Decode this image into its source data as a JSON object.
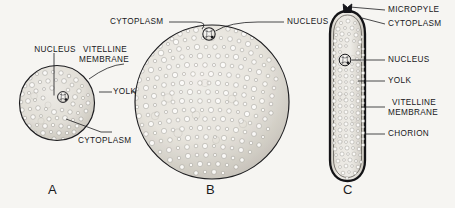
{
  "figure": {
    "background_color": "#f6f5f2",
    "ink_color": "#17171a"
  },
  "panels": [
    {
      "id": "A",
      "letter": "A",
      "shape": "circle",
      "description": "Small isolecithal egg with evenly distributed yolk",
      "labels": [
        "NUCLEUS",
        "VITELLINE MEMBRANE",
        "YOLK",
        "CYTOPLASM"
      ]
    },
    {
      "id": "B",
      "letter": "B",
      "shape": "circle",
      "description": "Large telolecithal egg with peripheral nucleus",
      "labels": [
        "CYTOPLASM",
        "NUCLEUS"
      ]
    },
    {
      "id": "C",
      "letter": "C",
      "shape": "capsule",
      "description": "Elongate insect egg with chorion and micropyle",
      "labels": [
        "MICROPYLE",
        "CYTOPLASM",
        "NUCLEUS",
        "YOLK",
        "VITELLINE MEMBRANE",
        "CHORION"
      ]
    }
  ],
  "labels": {
    "a_nucleus": "NUCLEUS",
    "a_vitelline_line1": "VITELLINE",
    "a_vitelline_line2": "MEMBRANE",
    "a_yolk": "YOLK",
    "a_cytoplasm": "CYTOPLASM",
    "b_cytoplasm": "CYTOPLASM",
    "b_nucleus": "NUCLEUS",
    "c_micropyle": "MICROPYLE",
    "c_cytoplasm": "CYTOPLASM",
    "c_nucleus": "NUCLEUS",
    "c_yolk": "YOLK",
    "c_vitelline_line1": "VITELLINE",
    "c_vitelline_line2": "MEMBRANE",
    "c_chorion": "CHORION"
  },
  "panel_letters": {
    "a": "A",
    "b": "B",
    "c": "C"
  }
}
